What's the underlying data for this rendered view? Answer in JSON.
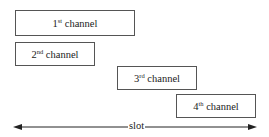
{
  "diagram": {
    "channels": [
      {
        "num": "1",
        "sup": "st",
        "text": " channel"
      },
      {
        "num": "2",
        "sup": "nd",
        "text": " channel"
      },
      {
        "num": "3",
        "sup": "rd",
        "text": " channel"
      },
      {
        "num": "4",
        "sup": "th",
        "text": " channel"
      }
    ],
    "axis_label": "slot",
    "colors": {
      "border": "#555555",
      "arrow": "#222222"
    }
  }
}
